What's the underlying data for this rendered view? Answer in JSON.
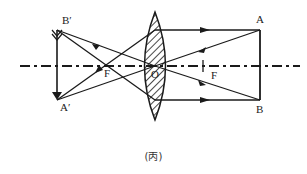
{
  "diagram": {
    "labels": {
      "A": "A",
      "B": "B",
      "A_prime": "A′",
      "B_prime": "B′",
      "F_left": "F",
      "F_right": "F",
      "O": "O"
    },
    "caption": "(丙)",
    "colors": {
      "line": "#1a1a1a",
      "background": "#ffffff"
    }
  }
}
